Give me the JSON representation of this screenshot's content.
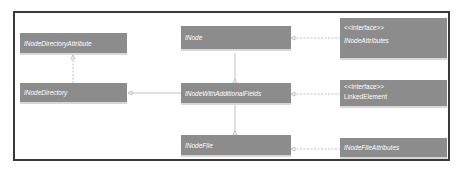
{
  "diagram": {
    "type": "class-diagram",
    "colors": {
      "node_fill": "#8c8c8c",
      "node_text": "#ffffff",
      "frame_border": "#3a3a3a",
      "edge": "#b0b0b0"
    },
    "nodes": [
      {
        "id": "inode_directory_attribute",
        "name": "INodeDirectoryAttribute",
        "stereotype": null
      },
      {
        "id": "inode_directory",
        "name": "INodeDirectory",
        "stereotype": null
      },
      {
        "id": "inode",
        "name": "INode",
        "stereotype": null
      },
      {
        "id": "inode_with_additional_fields",
        "name": "INodeWithAdditionalFields",
        "stereotype": null
      },
      {
        "id": "inode_file",
        "name": "INodeFile",
        "stereotype": null
      },
      {
        "id": "inode_attributes",
        "name": "INodeAttributes",
        "stereotype": "<<interface>>"
      },
      {
        "id": "linked_element",
        "name": "LinkedElement",
        "stereotype": "<<interface>>"
      },
      {
        "id": "inode_file_attributes",
        "name": "INodeFileAttributes",
        "stereotype": null
      }
    ],
    "edges": [
      {
        "from": "inode_directory",
        "to": "inode_directory_attribute",
        "style": "dashed",
        "kind": "realization"
      },
      {
        "from": "inode_directory",
        "to": "inode_with_additional_fields",
        "style": "solid",
        "kind": "generalization"
      },
      {
        "from": "inode_with_additional_fields",
        "to": "inode",
        "style": "solid",
        "kind": "generalization"
      },
      {
        "from": "inode_file",
        "to": "inode_with_additional_fields",
        "style": "solid",
        "kind": "generalization"
      },
      {
        "from": "inode",
        "to": "inode_attributes",
        "style": "dashed",
        "kind": "realization"
      },
      {
        "from": "inode_with_additional_fields",
        "to": "linked_element",
        "style": "dashed",
        "kind": "realization"
      },
      {
        "from": "inode_file",
        "to": "inode_file_attributes",
        "style": "dashed",
        "kind": "realization"
      }
    ]
  }
}
